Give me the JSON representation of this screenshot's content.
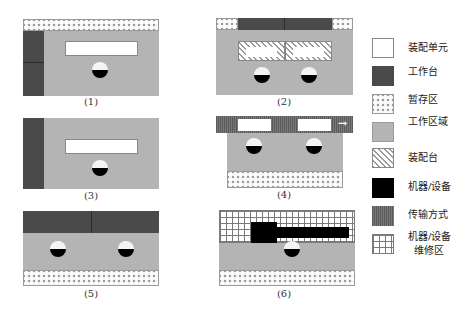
{
  "panels": [
    {
      "id": 1,
      "caption": "(1)",
      "elements": [
        "storage (top)",
        "workbench (left)",
        "assembly unit",
        "worker"
      ]
    },
    {
      "id": 2,
      "caption": "(2)",
      "elements": [
        "storage (top-left)",
        "workbench (top)",
        "storage (top-right)",
        "assembly station x2 with units",
        "worker x2"
      ]
    },
    {
      "id": 3,
      "caption": "(3)",
      "elements": [
        "workbench (left)",
        "assembly unit",
        "worker"
      ]
    },
    {
      "id": 4,
      "caption": "(4)",
      "elements": [
        "transport (top) with units x2",
        "direction arrow",
        "worker x2",
        "storage (bottom)"
      ]
    },
    {
      "id": 5,
      "caption": "(5)",
      "elements": [
        "workbench (top)",
        "worker x2",
        "storage (bottom)"
      ]
    },
    {
      "id": 6,
      "caption": "(6)",
      "elements": [
        "machine maintenance area (top)",
        "machine/equipment",
        "worker",
        "storage (bottom)"
      ]
    }
  ],
  "transport_arrow": "→",
  "legend": [
    {
      "key": "assembly-unit",
      "label": "装配单元"
    },
    {
      "key": "workbench",
      "label": "工作台"
    },
    {
      "key": "storage",
      "label": "暂存区"
    },
    {
      "key": "work-area",
      "label": "工作区域"
    },
    {
      "key": "assembly-station",
      "label": "装配台"
    },
    {
      "key": "machine",
      "label": "机器/设备"
    },
    {
      "key": "transport",
      "label": "传输方式"
    },
    {
      "key": "maintenance-area",
      "label_line1": "机器/设备",
      "label_line2": "维修区"
    }
  ],
  "colors": {
    "work_area": "#b4b4b4",
    "workbench": "#4a4a4a",
    "machine": "#000000",
    "transport": "#6e6e6e",
    "assembly_unit": "#ffffff"
  }
}
